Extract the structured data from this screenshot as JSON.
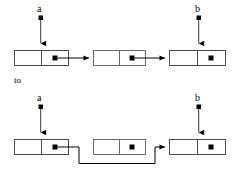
{
  "figure": {
    "kind": "linked-list-pointer-transition",
    "transition_label": "to",
    "colors": {
      "stroke": "#000000",
      "box_border": "#555555",
      "node_dot": "#000000",
      "background": "#ffffff"
    }
  },
  "top_state": {
    "name": "before",
    "pointers": [
      {
        "id": "a",
        "label": "a",
        "target": "node1"
      },
      {
        "id": "b",
        "label": "b",
        "target": "node3"
      }
    ],
    "nodes": [
      {
        "id": "node1",
        "has_data_cell": true,
        "has_pointer_dot": true,
        "links_to": "node2"
      },
      {
        "id": "node2",
        "has_data_cell": true,
        "has_pointer_dot": true,
        "links_to": "node3"
      },
      {
        "id": "node3",
        "has_data_cell": true,
        "has_pointer_dot": true,
        "links_to": null
      }
    ]
  },
  "bottom_state": {
    "name": "after",
    "pointers": [
      {
        "id": "a",
        "label": "a",
        "target": "node1"
      },
      {
        "id": "b",
        "label": "b",
        "target": "node3"
      }
    ],
    "nodes": [
      {
        "id": "node1",
        "has_data_cell": true,
        "has_pointer_dot": true,
        "links_to": "node3"
      },
      {
        "id": "node2",
        "has_data_cell": true,
        "has_pointer_dot": true,
        "links_to": null
      },
      {
        "id": "node3",
        "has_data_cell": true,
        "has_pointer_dot": true,
        "links_to": null
      }
    ]
  },
  "geometry": {
    "box_width": 54,
    "box_height": 15,
    "top_row_y": 50,
    "bottom_row_y": 139,
    "columns_x": [
      14,
      93,
      169
    ]
  }
}
